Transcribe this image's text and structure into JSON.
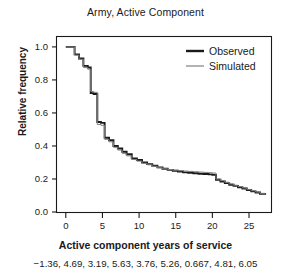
{
  "chart_data": {
    "type": "line",
    "title": "Army, Active Component",
    "xlabel": "Active component years of service",
    "ylabel": "Relative frequency",
    "xlim": [
      -1.2,
      28.0
    ],
    "ylim": [
      0.0,
      1.06
    ],
    "grid": false,
    "legend_position": "top-right",
    "xticks": [
      "0",
      "5",
      "10",
      "15",
      "20",
      "25"
    ],
    "xtick_values": [
      0,
      5,
      10,
      15,
      20,
      25
    ],
    "yticks": [
      "0.0",
      "0.2",
      "0.4",
      "0.6",
      "0.8",
      "1.0"
    ],
    "ytick_values": [
      0.0,
      0.2,
      0.4,
      0.6,
      0.8,
      1.0
    ],
    "series": [
      {
        "name": "Observed",
        "color": "#1a1a1a",
        "style": "step",
        "x": [
          0,
          0.6,
          1.2,
          1.8,
          2.4,
          3.0,
          3.4,
          3.8,
          4.3,
          4.8,
          5.3,
          5.9,
          6.5,
          7.1,
          7.7,
          8.3,
          9.0,
          9.7,
          10.4,
          11.1,
          11.8,
          12.5,
          13.2,
          13.9,
          14.6,
          15.3,
          16.0,
          16.7,
          17.4,
          18.1,
          18.8,
          19.5,
          20.0,
          20.5,
          21.1,
          21.7,
          22.3,
          22.9,
          23.5,
          24.1,
          24.7,
          25.3,
          25.9,
          26.5,
          27.2
        ],
        "y": [
          1.0,
          1.0,
          0.955,
          0.93,
          0.885,
          0.875,
          0.72,
          0.715,
          0.545,
          0.54,
          0.45,
          0.435,
          0.4,
          0.385,
          0.365,
          0.35,
          0.325,
          0.315,
          0.3,
          0.29,
          0.28,
          0.27,
          0.262,
          0.255,
          0.25,
          0.245,
          0.24,
          0.238,
          0.235,
          0.232,
          0.23,
          0.228,
          0.225,
          0.195,
          0.185,
          0.175,
          0.165,
          0.158,
          0.15,
          0.142,
          0.133,
          0.125,
          0.118,
          0.11,
          0.105
        ]
      },
      {
        "name": "Simulated",
        "color": "#808080",
        "style": "step",
        "x": [
          0,
          0.6,
          1.2,
          1.8,
          2.4,
          3.0,
          3.4,
          3.8,
          4.3,
          4.8,
          5.3,
          5.9,
          6.5,
          7.1,
          7.7,
          8.3,
          9.0,
          9.7,
          10.4,
          11.1,
          11.8,
          12.5,
          13.2,
          13.9,
          14.6,
          15.3,
          16.0,
          16.7,
          17.4,
          18.1,
          18.8,
          19.5,
          20.0,
          20.5,
          21.1,
          21.7,
          22.3,
          22.9,
          23.5,
          24.1,
          24.7,
          25.3,
          25.9,
          26.5,
          27.2
        ],
        "y": [
          1.0,
          1.0,
          0.95,
          0.925,
          0.875,
          0.865,
          0.73,
          0.725,
          0.53,
          0.525,
          0.44,
          0.425,
          0.392,
          0.375,
          0.355,
          0.34,
          0.318,
          0.308,
          0.295,
          0.286,
          0.277,
          0.268,
          0.262,
          0.257,
          0.253,
          0.25,
          0.248,
          0.246,
          0.244,
          0.242,
          0.24,
          0.238,
          0.236,
          0.2,
          0.19,
          0.18,
          0.17,
          0.162,
          0.154,
          0.146,
          0.137,
          0.129,
          0.121,
          0.113,
          0.108
        ]
      }
    ],
    "legend": [
      {
        "label": "Observed",
        "color": "#1a1a1a",
        "width": 2.4
      },
      {
        "label": "Simulated",
        "color": "#808080",
        "width": 1.2
      }
    ],
    "caption": "−1.36, 4.69, 3.19, 5.63, 3.76, 5.26, 0.667, 4.81, 6.05"
  }
}
